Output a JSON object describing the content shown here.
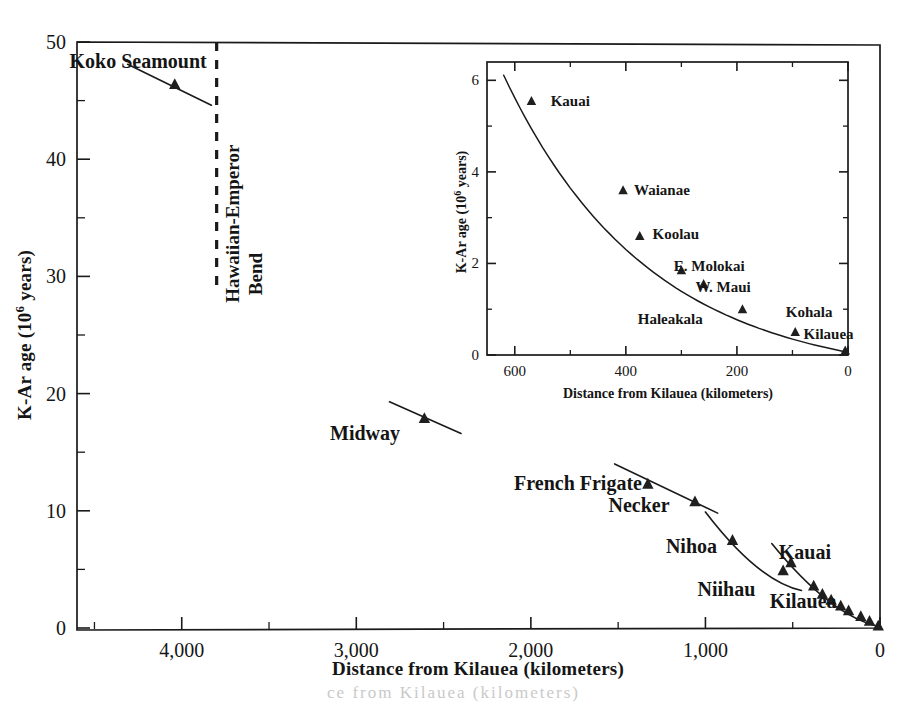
{
  "figure": {
    "kind": "scatter-with-trend",
    "background": "#ffffff",
    "ink_color": "#1a1a1a"
  },
  "main": {
    "xlabel": "Distance from Kilauea  (kilometers)",
    "ylabel_prefix": "K-Ar age  (10",
    "ylabel_sup": "6",
    "ylabel_suffix": " years)",
    "xticks": [
      "4,000",
      "3,000",
      "2,000",
      "1,000",
      "0"
    ],
    "xtick_values": [
      4000,
      3000,
      2000,
      1000,
      0
    ],
    "yticks": [
      "0",
      "10",
      "20",
      "30",
      "40",
      "50"
    ],
    "ytick_values": [
      0,
      10,
      20,
      30,
      40,
      50
    ],
    "xlim": [
      4600,
      0
    ],
    "ylim": [
      0,
      50
    ],
    "xminor_step": 500,
    "yminor_step": 5,
    "grid": "off",
    "annotations": [
      {
        "text": "Koko Seamount",
        "x": 4250,
        "y": 47.8
      },
      {
        "text": "Midway",
        "x": 2950,
        "y": 16.0
      },
      {
        "text": "French Frigate",
        "x": 1730,
        "y": 11.8
      },
      {
        "text": "Necker",
        "x": 1380,
        "y": 9.9
      },
      {
        "text": "Nihoa",
        "x": 1080,
        "y": 6.4
      },
      {
        "text": "Niihau",
        "x": 880,
        "y": 2.7
      },
      {
        "text": "Kauai",
        "x": 430,
        "y": 5.9
      },
      {
        "text": "Kilauea",
        "x": 440,
        "y": 1.7
      }
    ],
    "bend_marker": {
      "label_line1": "Hawaiian-Emperor",
      "label_line2": "Bend",
      "x": 3800,
      "y_from": 50,
      "y_to": 28.5
    },
    "points": [
      {
        "name": "Koko Seamount",
        "x": 4040,
        "y": 46.4
      },
      {
        "name": "Midway",
        "x": 2610,
        "y": 17.9
      },
      {
        "name": "French Frigate Shoals",
        "x": 1330,
        "y": 12.3
      },
      {
        "name": "Necker",
        "x": 1060,
        "y": 10.8
      },
      {
        "name": "Nihoa",
        "x": 845,
        "y": 7.5
      },
      {
        "name": "Niihau",
        "x": 555,
        "y": 4.9
      },
      {
        "name": "Kauai",
        "x": 510,
        "y": 5.6
      },
      {
        "name": "Oahu-Waianae",
        "x": 380,
        "y": 3.6
      },
      {
        "name": "Oahu-Koolau",
        "x": 330,
        "y": 2.9
      },
      {
        "name": "Molokai",
        "x": 280,
        "y": 2.4
      },
      {
        "name": "Maui",
        "x": 225,
        "y": 1.9
      },
      {
        "name": "Haleakala",
        "x": 180,
        "y": 1.5
      },
      {
        "name": "Kohala",
        "x": 110,
        "y": 1.0
      },
      {
        "name": "Mauna Kea",
        "x": 60,
        "y": 0.6
      },
      {
        "name": "Kilauea",
        "x": 10,
        "y": 0.2
      }
    ],
    "trend_segments": [
      {
        "name": "emperor-koko",
        "from_x": 4310,
        "from_y": 48.1,
        "to_x": 3830,
        "to_y": 44.6
      },
      {
        "name": "midway",
        "from_x": 2810,
        "from_y": 19.3,
        "to_x": 2400,
        "to_y": 16.6
      },
      {
        "name": "french-frigate-necker",
        "from_x": 1520,
        "from_y": 14.0,
        "to_x": 930,
        "to_y": 9.8
      },
      {
        "name": "nihoa-niihau",
        "from_x": 1000,
        "from_y": 9.9,
        "to_x": 450,
        "to_y": 3.2
      },
      {
        "name": "hawaiian-chain",
        "from_x": 620,
        "from_y": 7.2,
        "to_x": 0,
        "to_y": 0.1
      }
    ]
  },
  "inset": {
    "xlabel": "Distance from Kilauea (kilometers)",
    "ylabel_prefix": "K-Ar age  (10",
    "ylabel_sup": "6",
    "ylabel_suffix": " years)",
    "xticks": [
      "600",
      "400",
      "200",
      "0"
    ],
    "xtick_values": [
      600,
      400,
      200,
      0
    ],
    "yticks": [
      "0",
      "2",
      "4",
      "6"
    ],
    "ytick_values": [
      0,
      2,
      4,
      6
    ],
    "xlim": [
      650,
      0
    ],
    "ylim": [
      0,
      6.4
    ],
    "xminor_step": 100,
    "yminor_step": 1,
    "grid": "off",
    "points": [
      {
        "name": "Kauai",
        "x": 570,
        "y": 5.55
      },
      {
        "name": "Waianae",
        "x": 405,
        "y": 3.6
      },
      {
        "name": "Koolau",
        "x": 375,
        "y": 2.6
      },
      {
        "name": "E. Molokai",
        "x": 300,
        "y": 1.85
      },
      {
        "name": "W. Maui",
        "x": 260,
        "y": 1.55
      },
      {
        "name": "Haleakala",
        "x": 190,
        "y": 1.0
      },
      {
        "name": "Kohala",
        "x": 95,
        "y": 0.5
      },
      {
        "name": "Kilauea",
        "x": 5,
        "y": 0.1
      }
    ],
    "labels": [
      {
        "text": "Kauai",
        "x": 500,
        "y": 5.55
      },
      {
        "text": "Waianae",
        "x": 335,
        "y": 3.6
      },
      {
        "text": "Koolau",
        "x": 310,
        "y": 2.65
      },
      {
        "text": "E. Molokai",
        "x": 250,
        "y": 1.95
      },
      {
        "text": "W. Maui",
        "x": 225,
        "y": 1.48
      },
      {
        "text": "Haleakala",
        "x": 320,
        "y": 0.78
      },
      {
        "text": "Kohala",
        "x": 70,
        "y": 0.93
      },
      {
        "text": "Kilauea",
        "x": 35,
        "y": 0.46
      }
    ],
    "curve_comment": "smooth monotonic decay from (620,6.1) to (0,0.08)"
  },
  "footer": {
    "smudge_text": "ce from Kilauea  (kilometers)"
  }
}
